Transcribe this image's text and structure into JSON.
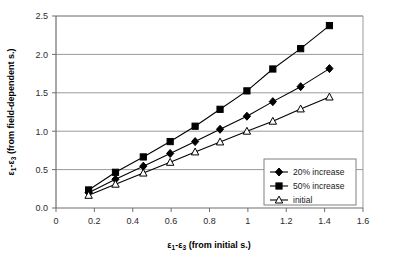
{
  "chart_data": {
    "type": "line",
    "title": "",
    "xlabel": "ε1-ε3 (from initial s.)",
    "ylabel": "ε1-ε3 (from field-dependent s.)",
    "xlim": [
      0,
      1.6
    ],
    "ylim": [
      0,
      2.5
    ],
    "xticks": [
      0,
      0.2,
      0.4,
      0.6,
      0.8,
      1,
      1.2,
      1.4,
      1.6
    ],
    "xtick_labels": [
      "0",
      "0.2",
      "0.4",
      "0.6",
      "0.8",
      "1",
      "1.2",
      "1.4",
      "1.6"
    ],
    "yticks": [
      0,
      0.5,
      1.0,
      1.5,
      2.0,
      2.5
    ],
    "ytick_labels": [
      "0.0",
      "0.5",
      "1.0",
      "1.5",
      "2.0",
      "2.5"
    ],
    "grid": "horizontal",
    "legend_position": "lower-right-inside",
    "x": [
      0.17,
      0.31,
      0.455,
      0.595,
      0.725,
      0.855,
      0.995,
      1.13,
      1.275,
      1.425
    ],
    "series": [
      {
        "name": "20% increase",
        "marker": "filled-diamond",
        "color": "#000000",
        "values": [
          0.2,
          0.375,
          0.545,
          0.71,
          0.865,
          1.025,
          1.195,
          1.385,
          1.58,
          1.815
        ]
      },
      {
        "name": "50% increase",
        "marker": "filled-square",
        "color": "#000000",
        "values": [
          0.235,
          0.465,
          0.665,
          0.865,
          1.065,
          1.285,
          1.525,
          1.81,
          2.075,
          2.375
        ]
      },
      {
        "name": "initial",
        "marker": "open-triangle",
        "color": "#000000",
        "values": [
          0.165,
          0.31,
          0.455,
          0.595,
          0.73,
          0.86,
          1.0,
          1.13,
          1.29,
          1.445
        ]
      }
    ]
  },
  "axes": {
    "x_title": "ε1-ε3 (from initial s.)",
    "y_title": "ε1-ε3 (from field-dependent s.)",
    "x_title_parts": {
      "e1": "ε",
      "sub1": "1",
      "dash": "-",
      "e3": "ε",
      "sub3": "3",
      "rest": " (from initial s.)"
    },
    "y_title_parts": {
      "e1": "ε",
      "sub1": "1",
      "dash": "-",
      "e3": "ε",
      "sub3": "3",
      "rest": " (from field-dependent s.)"
    }
  },
  "legend": {
    "items": [
      {
        "label": "20% increase",
        "marker": "filled-diamond"
      },
      {
        "label": "50% increase",
        "marker": "filled-square"
      },
      {
        "label": "initial",
        "marker": "open-triangle"
      }
    ]
  },
  "colors": {
    "line": "#000000",
    "grid": "#9a9a9a",
    "axis": "#6e6e6e",
    "background": "#ffffff",
    "legend_border": "#808080"
  }
}
